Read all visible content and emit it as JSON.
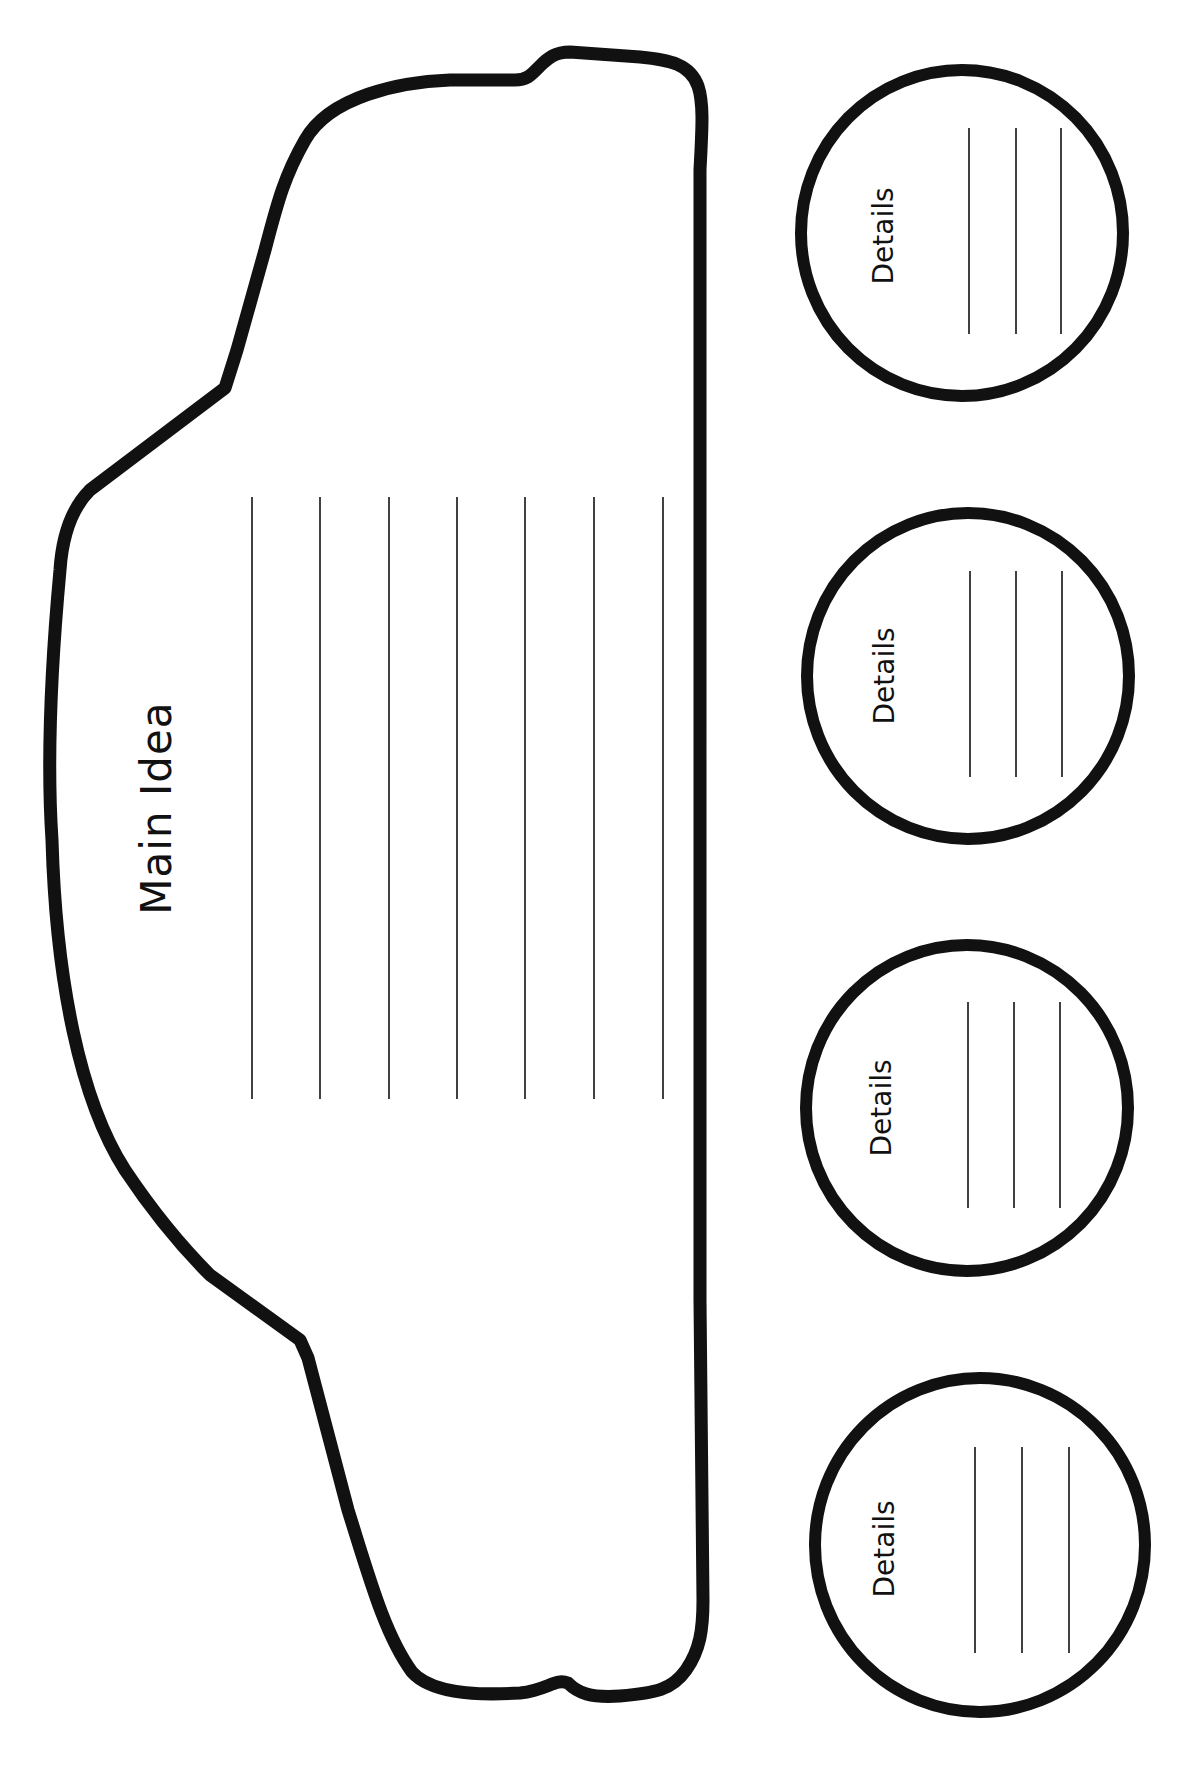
{
  "worksheet": {
    "type": "main-idea-and-details graphic organizer (car shape)",
    "orientation": "rotated 90 degrees counter-clockwise",
    "main_idea": {
      "label": "Main Idea",
      "writing_lines": 7
    },
    "details": [
      {
        "label": "Details",
        "writing_lines": 3
      },
      {
        "label": "Details",
        "writing_lines": 3
      },
      {
        "label": "Details",
        "writing_lines": 3
      },
      {
        "label": "Details",
        "writing_lines": 3
      }
    ],
    "colors": {
      "ink": "#111111",
      "paper": "#ffffff"
    }
  }
}
